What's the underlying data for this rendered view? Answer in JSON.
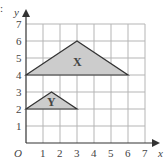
{
  "diagram": {
    "axes": {
      "x_label": "x",
      "y_label": "y",
      "origin_label": "O",
      "x_ticks": [
        "1",
        "2",
        "3",
        "4",
        "5",
        "6",
        "7"
      ],
      "y_ticks": [
        "1",
        "2",
        "3",
        "4",
        "5",
        "6",
        "7"
      ]
    },
    "shapes": [
      {
        "label": "X",
        "vertices": [
          [
            0,
            4
          ],
          [
            3,
            6
          ],
          [
            6,
            4
          ]
        ],
        "fill": "#cccccc"
      },
      {
        "label": "Y",
        "vertices": [
          [
            0,
            2
          ],
          [
            1.5,
            3
          ],
          [
            3,
            2
          ]
        ],
        "fill": "#cccccc"
      }
    ],
    "grid_color": "#b0b0b0",
    "line_color": "#333333",
    "corner_mark": ":"
  }
}
